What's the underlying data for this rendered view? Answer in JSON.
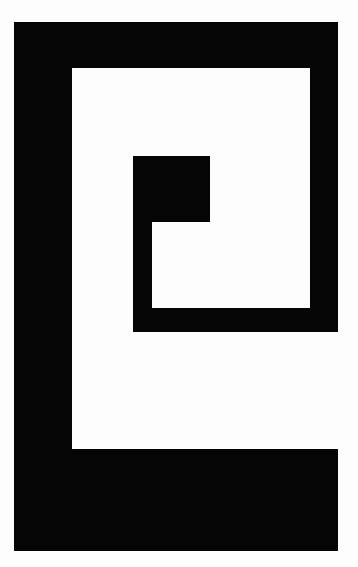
{
  "graphic": {
    "description": "Black geometric spiral / meander glyph on white background",
    "colors": {
      "background": "#fdfdfd",
      "foreground": "#050505"
    },
    "segments": [
      {
        "name": "top-bar",
        "x": 14,
        "y": 22,
        "w": 324,
        "h": 46
      },
      {
        "name": "right-bar",
        "x": 310,
        "y": 22,
        "w": 28,
        "h": 310
      },
      {
        "name": "left-bar",
        "x": 14,
        "y": 22,
        "w": 58,
        "h": 529
      },
      {
        "name": "bottom-bar",
        "x": 14,
        "y": 449,
        "w": 324,
        "h": 102
      },
      {
        "name": "inner-bottom-bar",
        "x": 133,
        "y": 308,
        "w": 205,
        "h": 24
      },
      {
        "name": "inner-left-bar",
        "x": 133,
        "y": 156,
        "w": 19,
        "h": 176
      },
      {
        "name": "inner-square",
        "x": 133,
        "y": 156,
        "w": 77,
        "h": 66
      }
    ]
  }
}
